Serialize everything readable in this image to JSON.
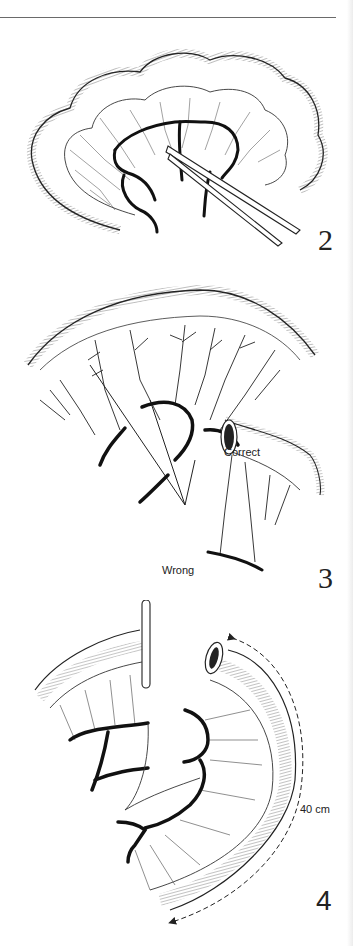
{
  "page": {
    "type": "surgical illustration page",
    "rule_color": "#6a6a6a",
    "ink_color": "#1a1a1a"
  },
  "figures": [
    {
      "number": "2",
      "description": "Small bowel loop with mesentery; vessel arcades divided and clamp applied"
    },
    {
      "number": "3",
      "description": "Mesenteric division showing correct and wrong technique",
      "labels": {
        "correct": "Correct",
        "wrong": "Wrong"
      }
    },
    {
      "number": "4",
      "description": "Mobilised bowel segment with vessels ligated, measured length",
      "measurement": "40 cm"
    }
  ]
}
